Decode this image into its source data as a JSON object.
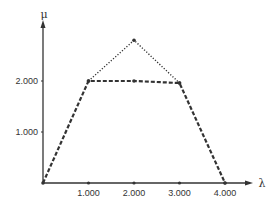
{
  "chart_data": {
    "type": "line",
    "title": "",
    "xlabel": "λ",
    "ylabel": "μ",
    "xlim": [
      0,
      4500
    ],
    "ylim": [
      0,
      3000
    ],
    "x_ticks": [
      1000,
      2000,
      3000,
      4000
    ],
    "x_tick_labels": [
      "1.000",
      "2.000",
      "3.000",
      "4.000"
    ],
    "y_ticks": [
      1000,
      2000
    ],
    "y_tick_labels": [
      "1.000",
      "2.000"
    ],
    "grid": false,
    "legend": null,
    "series": [
      {
        "name": "dashed",
        "style": "dashed",
        "x": [
          0,
          1000,
          2000,
          3000,
          4000
        ],
        "y": [
          0,
          2000,
          2000,
          1960,
          0
        ]
      },
      {
        "name": "dotted",
        "style": "dotted",
        "x": [
          1000,
          2000,
          3000
        ],
        "y": [
          2000,
          2800,
          1960
        ]
      }
    ]
  },
  "colors": {
    "ink": "#333333",
    "background": "#ffffff"
  }
}
